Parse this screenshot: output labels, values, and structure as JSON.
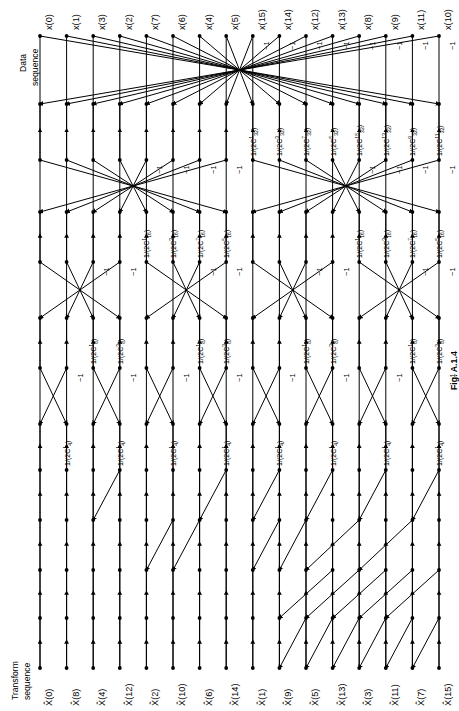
{
  "figure": {
    "caption": "Fig. A.1.4",
    "input_axis_label": "Data\nsequence",
    "input_axis_label_line1": "Data",
    "input_axis_label_line2": "sequence",
    "output_axis_label_line1": "Transform",
    "output_axis_label_line2": "sequence",
    "negative_one": "−1"
  },
  "inputs": [
    "x(0)",
    "x(1)",
    "x(3)",
    "x(2)",
    "x(7)",
    "x(6)",
    "x(4)",
    "x(5)",
    "x(15)",
    "x(14)",
    "x(12)",
    "x(13)",
    "x(8)",
    "x(9)",
    "x(11)",
    "x(10)"
  ],
  "outputs": [
    "X̂(0)",
    "X̂(8)",
    "X̂(4)",
    "X̂(12)",
    "X̂(2)",
    "X̂(10)",
    "X̂(6)",
    "X̂(14)",
    "X̂(1)",
    "X̂(9)",
    "X̂(5)",
    "X̂(13)",
    "X̂(3)",
    "X̂(11)",
    "X̂(7)",
    "X̂(15)"
  ],
  "stages": [
    {
      "name": "stage-1",
      "modulus": 32,
      "coefficients": [
        {
          "line": 8,
          "num": "1",
          "den": "2C",
          "sup": "1",
          "sub": "32"
        },
        {
          "line": 9,
          "num": "1",
          "den": "2C",
          "sup": "3",
          "sub": "32"
        },
        {
          "line": 10,
          "num": "1",
          "den": "2C",
          "sup": "7",
          "sub": "32"
        },
        {
          "line": 11,
          "num": "1",
          "den": "2C",
          "sup": "5",
          "sub": "32"
        },
        {
          "line": 12,
          "num": "1",
          "den": "2C",
          "sup": "15",
          "sub": "32"
        },
        {
          "line": 13,
          "num": "1",
          "den": "2C",
          "sup": "13",
          "sub": "32"
        },
        {
          "line": 14,
          "num": "1",
          "den": "2C",
          "sup": "9",
          "sub": "32"
        },
        {
          "line": 15,
          "num": "1",
          "den": "2C",
          "sup": "11",
          "sub": "32"
        }
      ],
      "negative_lines": [
        8,
        9,
        10,
        11,
        12,
        13,
        14,
        15
      ]
    },
    {
      "name": "stage-2",
      "modulus": 16,
      "coefficients": [
        {
          "line": 4,
          "num": "1",
          "den": "2C",
          "sup": "1",
          "sub": "16"
        },
        {
          "line": 5,
          "num": "1",
          "den": "2C",
          "sup": "3",
          "sub": "16"
        },
        {
          "line": 6,
          "num": "1",
          "den": "2C",
          "sup": "7",
          "sub": "16"
        },
        {
          "line": 7,
          "num": "1",
          "den": "2C",
          "sup": "5",
          "sub": "16"
        },
        {
          "line": 12,
          "num": "1",
          "den": "2C",
          "sup": "1",
          "sub": "16"
        },
        {
          "line": 13,
          "num": "1",
          "den": "2C",
          "sup": "3",
          "sub": "16"
        },
        {
          "line": 14,
          "num": "1",
          "den": "2C",
          "sup": "7",
          "sub": "16"
        },
        {
          "line": 15,
          "num": "1",
          "den": "2C",
          "sup": "5",
          "sub": "16"
        }
      ],
      "negative_lines": [
        4,
        5,
        6,
        7,
        12,
        13,
        14,
        15
      ]
    },
    {
      "name": "stage-3",
      "modulus": 8,
      "coefficients": [
        {
          "line": 2,
          "num": "1",
          "den": "2C",
          "sup": "1",
          "sub": "8"
        },
        {
          "line": 3,
          "num": "1",
          "den": "2C",
          "sup": "3",
          "sub": "8"
        },
        {
          "line": 6,
          "num": "1",
          "den": "2C",
          "sup": "1",
          "sub": "8"
        },
        {
          "line": 7,
          "num": "1",
          "den": "2C",
          "sup": "3",
          "sub": "8"
        },
        {
          "line": 10,
          "num": "1",
          "den": "2C",
          "sup": "1",
          "sub": "8"
        },
        {
          "line": 11,
          "num": "1",
          "den": "2C",
          "sup": "3",
          "sub": "8"
        },
        {
          "line": 14,
          "num": "1",
          "den": "2C",
          "sup": "1",
          "sub": "8"
        },
        {
          "line": 15,
          "num": "1",
          "den": "2C",
          "sup": "3",
          "sub": "8"
        }
      ],
      "negative_lines": [
        2,
        3,
        6,
        7,
        10,
        11,
        14,
        15
      ]
    },
    {
      "name": "stage-4",
      "modulus": 4,
      "coefficients": [
        {
          "line": 1,
          "num": "1",
          "den": "2C",
          "sup": "1",
          "sub": "4"
        },
        {
          "line": 3,
          "num": "1",
          "den": "2C",
          "sup": "1",
          "sub": "4"
        },
        {
          "line": 5,
          "num": "1",
          "den": "2C",
          "sup": "1",
          "sub": "4"
        },
        {
          "line": 7,
          "num": "1",
          "den": "2C",
          "sup": "1",
          "sub": "4"
        },
        {
          "line": 9,
          "num": "1",
          "den": "2C",
          "sup": "1",
          "sub": "4"
        },
        {
          "line": 11,
          "num": "1",
          "den": "2C",
          "sup": "1",
          "sub": "4"
        },
        {
          "line": 13,
          "num": "1",
          "den": "2C",
          "sup": "1",
          "sub": "4"
        },
        {
          "line": 15,
          "num": "1",
          "den": "2C",
          "sup": "1",
          "sub": "4"
        }
      ],
      "negative_lines": [
        1,
        3,
        5,
        7,
        9,
        11,
        13,
        15
      ]
    }
  ],
  "colors": {
    "line": "#000000",
    "background": "#ffffff",
    "text": "#000000"
  }
}
